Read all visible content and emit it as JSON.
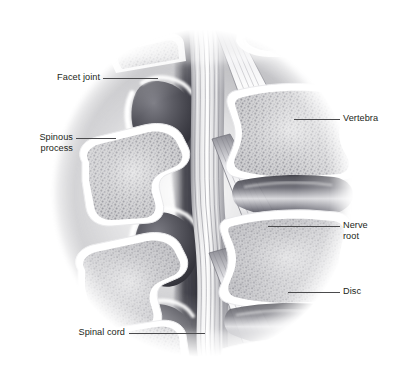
{
  "figure": {
    "type": "anatomical-illustration",
    "style": "grayscale medical line-and-tone drawing in an oval vignette inside a thin rectangular rule frame",
    "background_color": "#ffffff",
    "frame_color": "#3a3a3c",
    "label_color": "#231f20",
    "leader_color": "#4a4a4c",
    "bone_cortical_color": "#ffffff",
    "bone_trabecular_color": "#c9c9cb",
    "facet_joint_color": "#4d4d52",
    "vignette_shadow_color": "#8d8d92"
  },
  "labels": [
    {
      "id": "facet-joint",
      "text": "Facet joint",
      "side": "left"
    },
    {
      "id": "spinous",
      "text": "Spinous\nprocess",
      "side": "left"
    },
    {
      "id": "spinal-cord",
      "text": "Spinal cord",
      "side": "left"
    },
    {
      "id": "vertebra",
      "text": "Vertebra",
      "side": "right"
    },
    {
      "id": "nerve-root",
      "text": "Nerve\nroot",
      "side": "right"
    },
    {
      "id": "disc",
      "text": "Disc",
      "side": "right"
    }
  ],
  "anatomy": {
    "vertebra_count": 3,
    "facet_joint_count": 3,
    "spinous_process_count": 3,
    "disc_count": 2,
    "nerve_root_count": 3
  }
}
